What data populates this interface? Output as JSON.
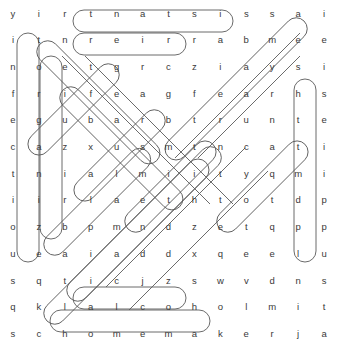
{
  "puzzle": {
    "type": "word-search",
    "rows": 13,
    "cols": 13,
    "cell_size": 23.1,
    "origin_x": 17,
    "origin_y": 9,
    "letter_color": "#3a3a3a",
    "mark_color": "#5a5a5a",
    "background": "#ffffff",
    "grid": [
      [
        "y",
        "i",
        "r",
        "t",
        "n",
        "a",
        "t",
        "s",
        "i",
        "s",
        "s",
        "a",
        "i"
      ],
      [
        "i",
        "t",
        "n",
        "r",
        "e",
        "i",
        "r",
        "r",
        "a",
        "b",
        "m",
        "e",
        "e"
      ],
      [
        "n",
        "o",
        "e",
        "t",
        "g",
        "r",
        "c",
        "z",
        "i",
        "a",
        "y",
        "s",
        "i"
      ],
      [
        "f",
        "r",
        "i",
        "f",
        "e",
        "a",
        "g",
        "f",
        "e",
        "a",
        "r",
        "h",
        "s"
      ],
      [
        "e",
        "g",
        "u",
        "b",
        "a",
        "r",
        "b",
        "t",
        "r",
        "u",
        "n",
        "t",
        "e"
      ],
      [
        "c",
        "a",
        "z",
        "x",
        "u",
        "s",
        "m",
        "t",
        "n",
        "c",
        "a",
        "t",
        "i"
      ],
      [
        "t",
        "n",
        "i",
        "a",
        "l",
        "m",
        "i",
        "i",
        "t",
        "y",
        "q",
        "m",
        "i"
      ],
      [
        "i",
        "i",
        "r",
        "l",
        "a",
        "e",
        "t",
        "h",
        "t",
        "o",
        "t",
        "d",
        "p"
      ],
      [
        "o",
        "z",
        "b",
        "p",
        "m",
        "n",
        "d",
        "z",
        "e",
        "t",
        "q",
        "p",
        "p"
      ],
      [
        "u",
        "e",
        "a",
        "i",
        "a",
        "d",
        "d",
        "x",
        "q",
        "e",
        "e",
        "l",
        "u"
      ],
      [
        "s",
        "q",
        "t",
        "i",
        "c",
        "j",
        "z",
        "s",
        "w",
        "v",
        "d",
        "n",
        "s"
      ],
      [
        "q",
        "k",
        "l",
        "a",
        "l",
        "c",
        "o",
        "h",
        "o",
        "l",
        "m",
        "i",
        "t"
      ],
      [
        "s",
        "c",
        "h",
        "o",
        "m",
        "e",
        "m",
        "a",
        "k",
        "e",
        "r",
        "j",
        "a"
      ]
    ],
    "found_words": [
      {
        "word": "assistant",
        "direction": "horizontal-reversed",
        "start_row": 0,
        "start_col": 11,
        "end_row": 0,
        "end_col": 3
      },
      {
        "word": "barrier",
        "direction": "horizontal-reversed",
        "start_row": 1,
        "start_col": 9,
        "end_row": 1,
        "end_col": 3
      },
      {
        "word": "alcohol",
        "direction": "horizontal",
        "start_row": 11,
        "start_col": 3,
        "end_row": 11,
        "end_col": 9
      },
      {
        "word": "homemaker",
        "direction": "horizontal",
        "start_row": 12,
        "start_col": 2,
        "end_row": 12,
        "end_col": 10
      },
      {
        "word": "infectious",
        "direction": "vertical",
        "start_row": 1,
        "start_col": 0,
        "end_row": 10,
        "end_col": 0
      },
      {
        "word": "organize",
        "direction": "vertical",
        "start_row": 2,
        "start_col": 1,
        "end_row": 9,
        "end_col": 1
      },
      {
        "word": "supplies",
        "direction": "vertical-reversed",
        "start_row": 10,
        "start_col": 12,
        "end_row": 3,
        "end_col": 12
      },
      {
        "word": "transmit",
        "direction": "diagonal-up-right",
        "start_row": 12,
        "start_col": 1,
        "end_row": 5,
        "end_col": 8
      },
      {
        "word": "bath",
        "direction": "diagonal-down-left",
        "start_row": 4,
        "start_col": 6,
        "end_row": 7,
        "end_col": 3
      },
      {
        "word": "diet",
        "direction": "diagonal-up-right",
        "start_row": 9,
        "start_col": 5,
        "end_row": 6,
        "end_col": 8
      },
      {
        "word": "client",
        "direction": "diagonal-down-right",
        "start_row": 1,
        "start_col": 1,
        "end_row": 6,
        "end_col": 6
      },
      {
        "word": "gait",
        "direction": "diagonal-down-left",
        "start_row": 2,
        "start_col": 4,
        "end_row": 5,
        "end_col": 1
      },
      {
        "word": "hygiene",
        "direction": "diagonal-down-left",
        "start_row": 0,
        "start_col": 12,
        "end_row": 6,
        "end_col": 6
      },
      {
        "word": "elderly",
        "direction": "diagonal-up-right",
        "start_row": 11,
        "start_col": 3,
        "end_row": 5,
        "end_col": 9
      },
      {
        "word": "safety",
        "direction": "diagonal-down-right",
        "start_row": 3,
        "start_col": 2,
        "end_row": 8,
        "end_col": 7
      },
      {
        "word": "meals",
        "direction": "diagonal-up-right",
        "start_row": 10,
        "start_col": 2,
        "end_row": 6,
        "end_col": 6
      },
      {
        "word": "care",
        "direction": "diagonal-up-right",
        "start_row": 9,
        "start_col": 9,
        "end_row": 6,
        "end_col": 12
      }
    ]
  }
}
